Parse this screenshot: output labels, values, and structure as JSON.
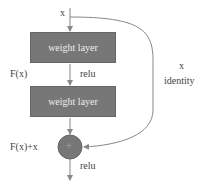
{
  "diagram": {
    "type": "residual-block",
    "input_label": "x",
    "layers": [
      {
        "label": "weight layer"
      },
      {
        "label": "weight layer"
      }
    ],
    "intermediate_label": "F(x)",
    "activation_1": "relu",
    "sum_label": "F(x)+x",
    "sum_symbol": "+",
    "activation_2": "relu",
    "skip": {
      "label_top": "x",
      "label_bottom": "identity"
    },
    "colors": {
      "box": "#777777",
      "line": "#888888",
      "text": "#444444"
    }
  }
}
